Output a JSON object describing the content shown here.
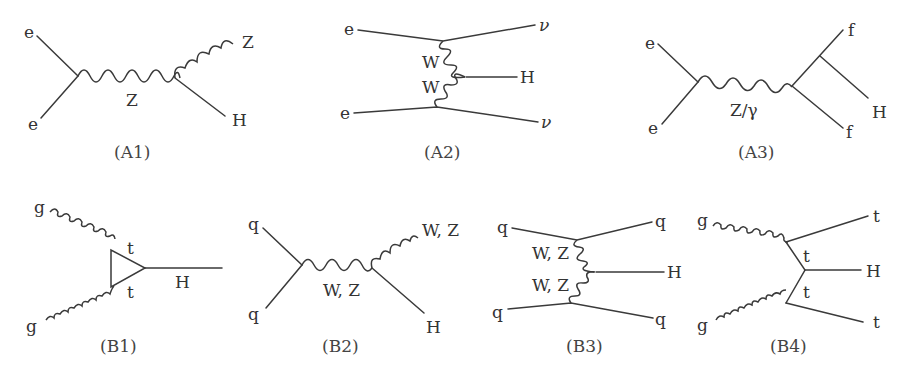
{
  "figure": {
    "colors": {
      "line": "#3a3a3a",
      "text": "#333333",
      "background": "#ffffff"
    },
    "diagrams": [
      {
        "id": "A1",
        "caption": "(A1)",
        "process": "Higgs-strahlung (e+e- -> ZH)",
        "labels": {
          "in_top": "e",
          "in_bottom": "e",
          "propagator": "Z",
          "out_boson": "Z",
          "out_higgs": "H"
        }
      },
      {
        "id": "A2",
        "caption": "(A2)",
        "process": "WW fusion (e+e- -> nu nu H)",
        "labels": {
          "in_top": "e",
          "in_bottom": "e",
          "out_top": "ν",
          "out_bottom": "ν",
          "boson_top": "W",
          "boson_bottom": "W",
          "out_higgs": "H"
        }
      },
      {
        "id": "A3",
        "caption": "(A3)",
        "process": "Higgs radiation off fermion (e+e- -> ffH)",
        "labels": {
          "in_top": "e",
          "in_bottom": "e",
          "propagator": "Z/γ",
          "out_top": "f",
          "out_bottom": "f",
          "out_higgs": "H"
        }
      },
      {
        "id": "B1",
        "caption": "(B1)",
        "process": "Gluon fusion via top loop (gg -> H)",
        "labels": {
          "in_top": "g",
          "in_bottom": "g",
          "loop_top": "t",
          "loop_bottom": "t",
          "out_higgs": "H"
        }
      },
      {
        "id": "B2",
        "caption": "(B2)",
        "process": "Associated production (qq -> VH)",
        "labels": {
          "in_top": "q",
          "in_bottom": "q",
          "propagator": "W, Z",
          "out_boson": "W, Z",
          "out_higgs": "H"
        }
      },
      {
        "id": "B3",
        "caption": "(B3)",
        "process": "Vector boson fusion (qq -> qqH)",
        "labels": {
          "in_top": "q",
          "in_bottom": "q",
          "out_top": "q",
          "out_bottom": "q",
          "boson_top": "W, Z",
          "boson_bottom": "W, Z",
          "out_higgs": "H"
        }
      },
      {
        "id": "B4",
        "caption": "(B4)",
        "process": "ttH associated production (gg -> ttH)",
        "labels": {
          "in_top": "g",
          "in_bottom": "g",
          "prop_top": "t",
          "prop_bottom": "t",
          "out_top": "t",
          "out_bottom": "t",
          "out_higgs": "H"
        }
      }
    ]
  }
}
